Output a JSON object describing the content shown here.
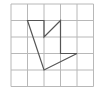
{
  "diagram": {
    "type": "grid-polygon",
    "grid": {
      "columns": 5,
      "rows": 5,
      "origin_px": [
        11,
        4
      ],
      "cell_px": 16.5,
      "line_color": "#b8b8b8"
    },
    "polygon": {
      "stroke_color": "#555555",
      "vertices_grid": [
        [
          1,
          1
        ],
        [
          2,
          1
        ],
        [
          2,
          2
        ],
        [
          3,
          1
        ],
        [
          3,
          3
        ],
        [
          4,
          3
        ],
        [
          2,
          4
        ]
      ]
    }
  }
}
